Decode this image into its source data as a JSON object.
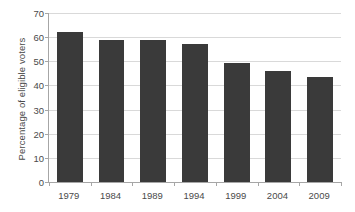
{
  "chart_data": {
    "type": "bar",
    "title": "",
    "subtitle": "",
    "xlabel": "",
    "ylabel": "Percentage of eligible voters",
    "categories": [
      "1979",
      "1984",
      "1989",
      "1994",
      "1999",
      "2004",
      "2009"
    ],
    "values": [
      62,
      59,
      58.8,
      57,
      49.5,
      46,
      43.5
    ],
    "ylim": [
      0,
      70
    ],
    "y_ticks": [
      0,
      10,
      20,
      30,
      40,
      50,
      60,
      70
    ],
    "y_tick_labels": [
      "0",
      "10",
      "20",
      "30",
      "40",
      "50",
      "60",
      "70"
    ],
    "grid": "horizontal",
    "legend": "none",
    "bar_color": "#3a3a3a",
    "gridline_color": "#d9d9d9",
    "axis_color": "#a6a6a6",
    "background_color": "#ffffff",
    "text_color": "#4a4a4a"
  }
}
